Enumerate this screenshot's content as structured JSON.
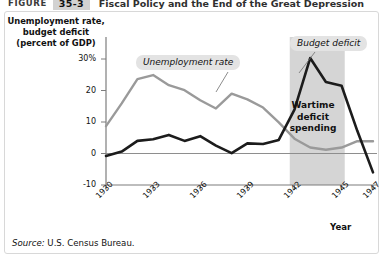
{
  "header": {
    "figure_word": "FIGURE",
    "figure_number": "35-3",
    "title": "Fiscal Policy and the End of the Great Depression"
  },
  "axes": {
    "y_title": "Unemployment rate,\nbudget deficit\n(percent of GDP)",
    "x_title": "Year"
  },
  "source": {
    "prefix": "Source:",
    "text": "U.S. Census Bureau."
  },
  "callouts": {
    "unemployment": "Unemployment rate",
    "budget_deficit": "Budget deficit",
    "wartime": "Wartime\ndeficit\nspending"
  },
  "chart_data": {
    "type": "line",
    "title": "Fiscal Policy and the End of the Great Depression",
    "xlabel": "Year",
    "ylabel": "Unemployment rate, budget deficit (percent of GDP)",
    "xlim": [
      1930,
      1947
    ],
    "ylim": [
      -10,
      32
    ],
    "ytick_labels": [
      "30%",
      "20",
      "10",
      "0",
      "-10"
    ],
    "ytick_values": [
      30,
      20,
      10,
      0,
      -10
    ],
    "xtick_labels": [
      "1930",
      "1933",
      "1936",
      "1939",
      "1942",
      "1945",
      "1947"
    ],
    "xtick_values": [
      1930,
      1933,
      1936,
      1939,
      1942,
      1945,
      1947
    ],
    "grid": false,
    "legend": "inline-callouts",
    "zero_line": 0,
    "shaded_region": {
      "label": "Wartime deficit spending",
      "x_start": 1941.7,
      "x_end": 1945.2,
      "color": "#d5d5d5"
    },
    "x": [
      1930,
      1931,
      1932,
      1933,
      1934,
      1935,
      1936,
      1937,
      1938,
      1939,
      1940,
      1941,
      1942,
      1943,
      1944,
      1945,
      1946,
      1947
    ],
    "series": [
      {
        "name": "Unemployment rate",
        "color": "#9a9a9a",
        "values": [
          8.7,
          15.9,
          23.6,
          24.9,
          21.7,
          20.1,
          16.9,
          14.3,
          19.0,
          17.2,
          14.6,
          9.9,
          4.7,
          1.9,
          1.2,
          1.9,
          3.9,
          3.9
        ]
      },
      {
        "name": "Budget deficit",
        "color": "#1c1c1c",
        "values": [
          -0.8,
          0.6,
          4.0,
          4.5,
          5.9,
          4.0,
          5.5,
          2.5,
          0.1,
          3.2,
          3.0,
          4.3,
          13.9,
          30.3,
          22.7,
          21.5,
          7.2,
          -6.0
        ]
      }
    ]
  }
}
